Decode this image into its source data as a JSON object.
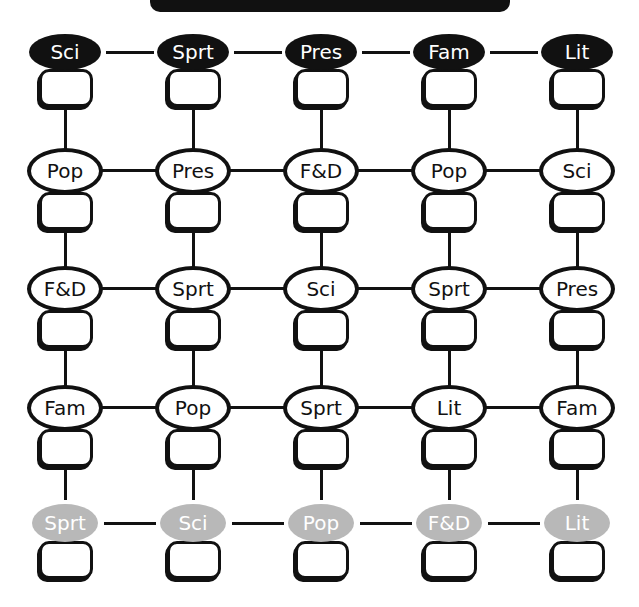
{
  "banner": {
    "text": ""
  },
  "colors": {
    "dark_fill": "#111111",
    "light_fill": "#ffffff",
    "gray_fill": "#b8b8b8",
    "line": "#111111"
  },
  "grid": {
    "columns": 5,
    "rows": [
      {
        "style": "dark",
        "labels": [
          "Sci",
          "Sprt",
          "Pres",
          "Fam",
          "Lit"
        ]
      },
      {
        "style": "light",
        "labels": [
          "Pop",
          "Pres",
          "F&D",
          "Pop",
          "Sci"
        ]
      },
      {
        "style": "light",
        "labels": [
          "F&D",
          "Sprt",
          "Sci",
          "Sprt",
          "Pres"
        ]
      },
      {
        "style": "light",
        "labels": [
          "Fam",
          "Pop",
          "Sprt",
          "Lit",
          "Fam"
        ]
      },
      {
        "style": "gray",
        "labels": [
          "Sprt",
          "Sci",
          "Pop",
          "F&D",
          "Lit"
        ]
      }
    ],
    "answer_boxes": [
      [
        "",
        "",
        "",
        "",
        ""
      ],
      [
        "",
        "",
        "",
        "",
        ""
      ],
      [
        "",
        "",
        "",
        "",
        ""
      ],
      [
        "",
        "",
        "",
        "",
        ""
      ],
      [
        "",
        "",
        "",
        "",
        ""
      ]
    ]
  }
}
